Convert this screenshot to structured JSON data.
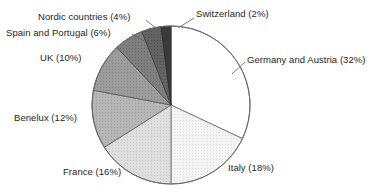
{
  "chart_data": {
    "type": "pie",
    "title": "",
    "subtitle": "",
    "xlabel": "",
    "ylabel": "",
    "legend_position": "none",
    "grid": false,
    "units": "percent",
    "total": 100,
    "start_angle_deg": 0,
    "direction": "clockwise",
    "categories": [
      "Germany and Austria",
      "Italy",
      "France",
      "Benelux",
      "UK",
      "Spain and Portugal",
      "Nordic countries",
      "Switzerland"
    ],
    "values": [
      32,
      18,
      16,
      12,
      10,
      6,
      4,
      2
    ],
    "slices": [
      {
        "name": "germany-austria",
        "label": "Germany and Austria (32%)",
        "category": "Germany and Austria",
        "value": 32,
        "start_deg": 0,
        "end_deg": 115.2,
        "fill": "#ffffff",
        "stroke": "#555555"
      },
      {
        "name": "italy",
        "label": "Italy (18%)",
        "category": "Italy",
        "value": 18,
        "start_deg": 115.2,
        "end_deg": 180.0,
        "fill": "#f2f2f2",
        "stroke": "#707070"
      },
      {
        "name": "france",
        "label": "France (16%)",
        "category": "France",
        "value": 16,
        "start_deg": 180.0,
        "end_deg": 237.6,
        "fill": "#dcdcdc",
        "stroke": "#707070"
      },
      {
        "name": "benelux",
        "label": "Benelux (12%)",
        "category": "Benelux",
        "value": 12,
        "start_deg": 237.6,
        "end_deg": 280.8,
        "fill": "#b4b4b4",
        "stroke": "#606060"
      },
      {
        "name": "uk",
        "label": "UK (10%)",
        "category": "UK",
        "value": 10,
        "start_deg": 280.8,
        "end_deg": 316.8,
        "fill": "#9a9a9a",
        "stroke": "#555555"
      },
      {
        "name": "spain-portugal",
        "label": "Spain and Portugal (6%)",
        "category": "Spain and Portugal",
        "value": 6,
        "start_deg": 316.8,
        "end_deg": 338.4,
        "fill": "#7d7d7d",
        "stroke": "#4a4a4a"
      },
      {
        "name": "nordic-countries",
        "label": "Nordic countries (4%)",
        "category": "Nordic countries",
        "value": 4,
        "start_deg": 338.4,
        "end_deg": 352.8,
        "fill": "#616161",
        "stroke": "#3c3c3c"
      },
      {
        "name": "switzerland",
        "label": "Switzerland (2%)",
        "category": "Switzerland",
        "value": 2,
        "start_deg": 352.8,
        "end_deg": 360.0,
        "fill": "#3a3a3a",
        "stroke": "#2a2a2a"
      }
    ],
    "geometry": {
      "center_x": 171,
      "center_y": 105,
      "radius": 79
    },
    "colors": {
      "background": "#ffffff",
      "text": "#1e1e1e",
      "outline": "#6a6a6a",
      "leader_line": "#6a6a6a"
    }
  }
}
